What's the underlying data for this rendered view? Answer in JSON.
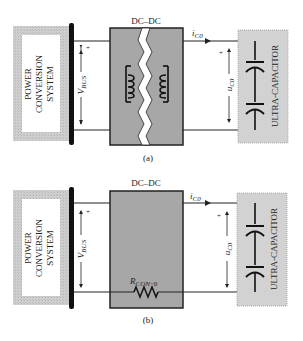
{
  "colors": {
    "background": "#ffffff",
    "pcs_hatch": "#c4c4c4",
    "pcs_inner": "#ffffff",
    "bus_bar": "#111111",
    "dcdc_fill": "#a7a7a7",
    "dcdc_border": "#222222",
    "ucap_fill": "#d2d2d2",
    "ucap_border": "#9a9a9a",
    "wire": "#222222",
    "break_fill": "#ffffff"
  },
  "diagram_a": {
    "caption": "(a)",
    "power_system": {
      "line1": "POWER",
      "line2": "CONVERSION",
      "line3": "SYSTEM"
    },
    "converter_label": "DC–DC",
    "converter_type": "isolated transformer (broken)",
    "bus_voltage": {
      "symbol": "V",
      "subscript": "BUS",
      "polarity": "+"
    },
    "current": {
      "symbol": "i",
      "subscript": "C0"
    },
    "cap_voltage": {
      "symbol": "u",
      "subscript": "C0",
      "polarity": "+"
    },
    "ultracap_label": "ULTRA-CAPACITOR"
  },
  "diagram_b": {
    "caption": "(b)",
    "power_system": {
      "line1": "POWER",
      "line2": "CONVERSION",
      "line3": "SYSTEM"
    },
    "converter_label": "DC–DC",
    "bus_voltage": {
      "symbol": "V",
      "subscript": "BUS",
      "polarity": "+"
    },
    "current": {
      "symbol": "i",
      "subscript": "C0"
    },
    "cap_voltage": {
      "symbol": "u",
      "subscript": "C0",
      "polarity": "+"
    },
    "resistor": {
      "symbol": "R",
      "subscript": "CON",
      "suffix": "−0"
    },
    "ultracap_label": "ULTRA-CAPACITOR"
  }
}
